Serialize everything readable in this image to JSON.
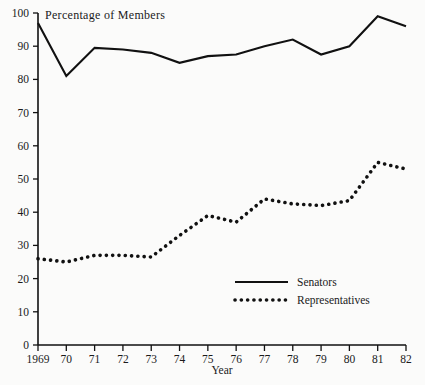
{
  "chart_data": {
    "type": "line",
    "title": "Percentage of Members",
    "xlabel": "Year",
    "ylabel": "",
    "x": [
      1969,
      1970,
      1971,
      1972,
      1973,
      1974,
      1975,
      1976,
      1977,
      1978,
      1979,
      1980,
      1981,
      1982
    ],
    "xtick_labels": [
      "1969",
      "70",
      "71",
      "72",
      "73",
      "74",
      "75",
      "76",
      "77",
      "78",
      "79",
      "80",
      "81",
      "82"
    ],
    "ytick_labels": [
      "0",
      "10",
      "20",
      "30",
      "40",
      "50",
      "60",
      "70",
      "80",
      "90",
      "100"
    ],
    "ytick_values": [
      0,
      10,
      20,
      30,
      40,
      50,
      60,
      70,
      80,
      90,
      100
    ],
    "ylim": [
      0,
      100
    ],
    "xlim": [
      1969,
      1982
    ],
    "grid": false,
    "legend_position": "lower-right",
    "series": [
      {
        "name": "Senators",
        "style": "solid",
        "color": "#111111",
        "values": [
          97,
          81,
          89.5,
          89,
          88,
          85,
          87,
          87.5,
          90,
          92,
          87.5,
          90,
          99,
          96
        ]
      },
      {
        "name": "Representatives",
        "style": "dotted",
        "color": "#111111",
        "values": [
          26,
          25,
          27,
          27,
          26.5,
          33,
          39,
          37,
          44,
          42.5,
          42,
          43.5,
          55,
          53
        ]
      }
    ]
  },
  "legend": {
    "items": [
      {
        "label": "Senators",
        "style": "solid"
      },
      {
        "label": "Representatives",
        "style": "dotted"
      }
    ]
  }
}
